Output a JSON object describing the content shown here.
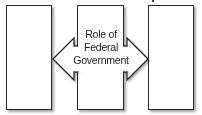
{
  "diagram": {
    "boxes": [
      {
        "id": "left",
        "label": ""
      },
      {
        "id": "center",
        "label": ""
      },
      {
        "id": "right",
        "label": ""
      }
    ],
    "arrow": {
      "type": "double-headed",
      "label_lines": [
        "Role of",
        "Federal",
        "Government"
      ]
    },
    "colors": {
      "stroke": "#2a2a2a",
      "fill": "#ffffff",
      "text": "#222222"
    }
  }
}
